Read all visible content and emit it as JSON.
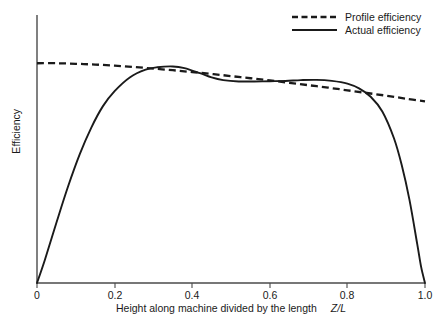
{
  "chart_data": {
    "type": "line",
    "title": "",
    "xlabel": "Height along machine divided by the length",
    "xlabel_symbol": "Z/L",
    "ylabel": "Efficiency",
    "xlim": [
      0,
      1.0
    ],
    "ylim": [
      0,
      1.0
    ],
    "grid": false,
    "legend_position": "top-right",
    "xticks": [
      "0",
      "0.2",
      "0.4",
      "0.6",
      "0.8",
      "1.0"
    ],
    "xtick_values": [
      0,
      0.2,
      0.4,
      0.6,
      0.8,
      1.0
    ],
    "yticks": [],
    "series": [
      {
        "name": "Profile efficiency",
        "style": "dashed",
        "color": "#1a1a1a",
        "x": [
          0.0,
          0.05,
          0.1,
          0.15,
          0.2,
          0.25,
          0.3,
          0.35,
          0.4,
          0.45,
          0.5,
          0.55,
          0.6,
          0.65,
          0.7,
          0.75,
          0.8,
          0.85,
          0.9,
          0.95,
          1.0
        ],
        "y": [
          0.82,
          0.82,
          0.818,
          0.815,
          0.811,
          0.806,
          0.8,
          0.794,
          0.787,
          0.78,
          0.772,
          0.764,
          0.756,
          0.747,
          0.738,
          0.729,
          0.719,
          0.709,
          0.699,
          0.688,
          0.678
        ]
      },
      {
        "name": "Actual efficiency",
        "style": "solid",
        "color": "#1a1a1a",
        "x": [
          0.0,
          0.02,
          0.05,
          0.08,
          0.11,
          0.14,
          0.17,
          0.2,
          0.24,
          0.28,
          0.31,
          0.35,
          0.38,
          0.42,
          0.45,
          0.48,
          0.52,
          0.56,
          0.6,
          0.64,
          0.68,
          0.72,
          0.76,
          0.8,
          0.83,
          0.86,
          0.89,
          0.92,
          0.94,
          0.96,
          0.98,
          0.99,
          1.0
        ],
        "y": [
          0.0,
          0.085,
          0.225,
          0.36,
          0.48,
          0.58,
          0.66,
          0.716,
          0.768,
          0.796,
          0.805,
          0.808,
          0.802,
          0.783,
          0.767,
          0.757,
          0.752,
          0.752,
          0.753,
          0.754,
          0.757,
          0.758,
          0.754,
          0.744,
          0.726,
          0.695,
          0.64,
          0.54,
          0.44,
          0.31,
          0.145,
          0.06,
          0.0
        ]
      }
    ]
  },
  "axis": {
    "x_tick_labels": [
      "0",
      "0.2",
      "0.4",
      "0.6",
      "0.8",
      "1.0"
    ],
    "x_title": "Height along machine divided by the length",
    "x_title_symbol": "Z/L",
    "y_title": "Efficiency"
  },
  "legend": {
    "items": [
      {
        "label": "Profile efficiency",
        "style": "dashed"
      },
      {
        "label": "Actual efficiency",
        "style": "solid"
      }
    ]
  },
  "colors": {
    "ink": "#1a1a1a",
    "axis": "#4a4a4a",
    "background": "#ffffff"
  }
}
